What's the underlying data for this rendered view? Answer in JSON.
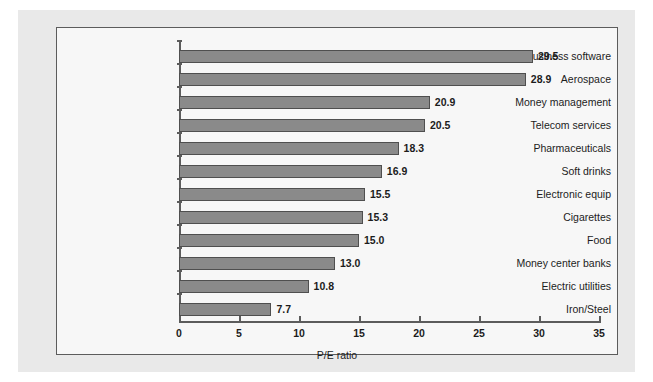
{
  "chart_data": {
    "type": "bar",
    "orientation": "horizontal",
    "title": "",
    "xlabel": "P/E ratio",
    "ylabel": "",
    "xlim": [
      0,
      35
    ],
    "xticks": [
      0,
      5,
      10,
      15,
      20,
      25,
      30,
      35
    ],
    "grid": false,
    "legend": null,
    "categories": [
      "Business software",
      "Aerospace",
      "Money management",
      "Telecom services",
      "Pharmaceuticals",
      "Soft drinks",
      "Electronic equip",
      "Cigarettes",
      "Food",
      "Money center banks",
      "Electric utilities",
      "Iron/Steel"
    ],
    "values": [
      29.5,
      28.9,
      20.9,
      20.5,
      18.3,
      16.9,
      15.5,
      15.3,
      15.0,
      13.0,
      10.8,
      7.7
    ],
    "value_labels": [
      "29.5",
      "28.9",
      "20.9",
      "20.5",
      "18.3",
      "16.9",
      "15.5",
      "15.3",
      "15.0",
      "13.0",
      "10.8",
      "7.7"
    ],
    "bar_color": "#8a8a8a",
    "bar_border_color": "#4f4f4f",
    "axis_color": "#5c5c5c",
    "plot_background": "#f7f7f7",
    "page_background": "#e9e9e9"
  }
}
